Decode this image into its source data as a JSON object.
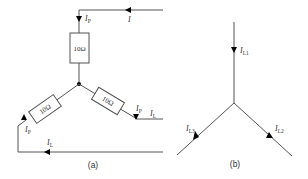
{
  "figure": {
    "panel_a": {
      "caption": "(a)",
      "resistors": [
        {
          "id": "r-top",
          "label": "10Ω"
        },
        {
          "id": "r-left",
          "label": "10Ω"
        },
        {
          "id": "r-right",
          "label": "10Ω"
        }
      ],
      "currents": {
        "line_top": {
          "main": "I",
          "sub": ""
        },
        "phase_top": {
          "main": "I",
          "sub": "P"
        },
        "phase_right": {
          "main": "I",
          "sub": "P"
        },
        "line_right": {
          "main": "I",
          "sub": "L"
        },
        "phase_left": {
          "main": "I",
          "sub": "P"
        },
        "line_bottom": {
          "main": "I",
          "sub": "L"
        }
      }
    },
    "panel_b": {
      "caption": "(b)",
      "currents": {
        "l1": {
          "main": "I",
          "sub": "L1"
        },
        "l2": {
          "main": "I",
          "sub": "L2"
        },
        "l3": {
          "main": "I",
          "sub": "L3"
        }
      }
    },
    "colors": {
      "wire": "#555555",
      "arrow": "#000000",
      "text": "#333333"
    }
  }
}
